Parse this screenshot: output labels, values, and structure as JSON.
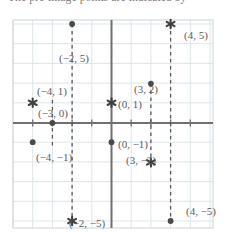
{
  "caption": {
    "text": "The pre-image points are indicated by"
  },
  "colors": {
    "grid": "#dde5ea",
    "axis": "#6f6f6f",
    "border": "#d3dade",
    "marker": "#4a4a4a",
    "dashed": "#5a5a5a",
    "label": "#5d5d5d",
    "background": "#ffffff"
  },
  "chart_data": {
    "type": "scatter",
    "title": "",
    "xlabel": "",
    "ylabel": "",
    "xlim": [
      -5,
      5
    ],
    "ylim": [
      -5.3,
      5.3
    ],
    "grid": true,
    "legend": "none",
    "axes": {
      "x_axis_y": 0,
      "y_axis_x": 0,
      "tick_step": 1
    },
    "series": [
      {
        "name": "pre-image",
        "marker": "dot",
        "points": [
          {
            "x": -2,
            "y": 5,
            "label": "(−2, 5)",
            "label_pos": "below"
          },
          {
            "x": -3,
            "y": 0,
            "label": "(−3, 0)",
            "label_pos": "above-right"
          },
          {
            "x": -4,
            "y": -1,
            "label": "(−4, −1)",
            "label_pos": "below"
          },
          {
            "x": 0,
            "y": -1,
            "label": "(0, −1)",
            "label_pos": "right"
          },
          {
            "x": 3,
            "y": 2,
            "label": "(3, 2)",
            "label_pos": "left"
          },
          {
            "x": 4,
            "y": -5,
            "label": "(4, −5)",
            "label_pos": "right"
          }
        ]
      },
      {
        "name": "image",
        "marker": "star",
        "points": [
          {
            "x": -4,
            "y": 1,
            "label": "(−4, 1)",
            "label_pos": "above"
          },
          {
            "x": 0,
            "y": 1,
            "label": "(0, 1)",
            "label_pos": "right"
          },
          {
            "x": 4,
            "y": 5,
            "label": "(4, 5)",
            "label_pos": "right"
          },
          {
            "x": 3,
            "y": -2,
            "label": "(3, −2)",
            "label_pos": "left"
          },
          {
            "x": -2,
            "y": -5,
            "label": "(−2, −5)",
            "label_pos": "below"
          }
        ]
      }
    ],
    "connectors": [
      {
        "name": "connector-x-neg2",
        "x": -2,
        "y_from": 5,
        "y_to": -5,
        "style": "dashed"
      },
      {
        "name": "connector-x-3",
        "x": 3,
        "y_from": 2,
        "y_to": -2,
        "style": "dashed"
      },
      {
        "name": "connector-x-4",
        "x": 4,
        "y_from": 5,
        "y_to": -5,
        "style": "dashed"
      },
      {
        "name": "connector-x-neg3",
        "x": -3,
        "y_from": 1,
        "y_to": -1,
        "style": "dashed"
      }
    ]
  },
  "labels": [
    {
      "name": "label-neg2-5",
      "text": "(−2, 5)",
      "left": 59,
      "top": 53
    },
    {
      "name": "label-4-5",
      "text": "(4, 5)",
      "left": 184,
      "top": 30
    },
    {
      "name": "label-neg4-1",
      "text": "(−4, 1)",
      "left": 37,
      "top": 86
    },
    {
      "name": "label-neg3-0",
      "text": "(−3, 0)",
      "left": 38,
      "top": 108
    },
    {
      "name": "label-0-1",
      "text": "(0, 1)",
      "left": 118,
      "top": 99
    },
    {
      "name": "label-3-2",
      "text": "(3, 2)",
      "left": 134,
      "top": 84
    },
    {
      "name": "label-neg4-neg1",
      "text": "(−4, −1)",
      "left": 36,
      "top": 152
    },
    {
      "name": "label-0-neg1",
      "text": "(0, −1)",
      "left": 118,
      "top": 139
    },
    {
      "name": "label-3-neg2",
      "text": "(3, −2)",
      "left": 126,
      "top": 155
    },
    {
      "name": "label-neg2-neg5",
      "text": "(−2, −5)",
      "left": 69,
      "top": 218
    },
    {
      "name": "label-4-neg5",
      "text": "(4, −5)",
      "left": 186,
      "top": 206
    }
  ]
}
